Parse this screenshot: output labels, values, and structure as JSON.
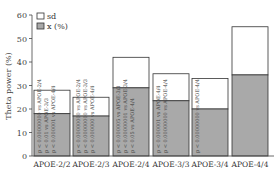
{
  "chart_data": {
    "type": "bar",
    "stacked": true,
    "title": "",
    "xlabel": "",
    "ylabel": "Theta power (%)",
    "ylim": [
      0,
      60
    ],
    "yticks": [
      0,
      10,
      20,
      30,
      40,
      50,
      60
    ],
    "grid": false,
    "legend_position": "upper-left",
    "categories": [
      "APOE-2/2",
      "APOE-2/3",
      "APOE-2/4",
      "APOE-3/3",
      "APOE-3/4",
      "APOE-4/4"
    ],
    "series": [
      {
        "name": "x (%)",
        "color": "#a9a9a9",
        "values": [
          18,
          17,
          29,
          23.5,
          20,
          34.5
        ]
      },
      {
        "name": "sd",
        "color": "#ffffff",
        "values": [
          10,
          8,
          13,
          11.5,
          13,
          20.5
        ]
      }
    ],
    "totals": [
      28,
      25,
      42,
      35,
      33,
      55
    ],
    "annotations": [
      [
        "p < 0.00000000 vs APOE-2/4",
        "p < 0.01 vs APOE-3/3",
        "p < 0.000001 vs APOE-4/4"
      ],
      [
        "p < 0.00000000 vs APOE-2/4",
        "p < 0.00000000 vs APOE-3/3",
        "p < 0.000000 vs APOE-4/4"
      ],
      [
        "p < 0.000005 vs APOE-3/3",
        "p < 0.00000001 vs APOE-3/4",
        "p < 0.05 vs APOE-4/4"
      ],
      [
        "p < 0.000001 vs APOE-4/4",
        "p < 0.00000000 vs APOE-4/4"
      ],
      [
        "p < 0.00000000 vs APOE-4/4"
      ],
      []
    ]
  },
  "legend": {
    "items": [
      {
        "label": "sd",
        "fill": "#ffffff"
      },
      {
        "label": "x (%)",
        "fill": "#a9a9a9"
      }
    ]
  }
}
